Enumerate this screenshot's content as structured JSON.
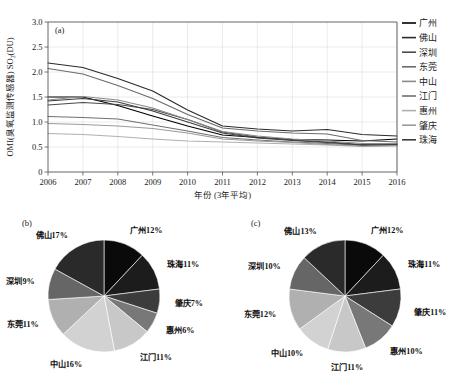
{
  "figure": {
    "panels": [
      "(a)",
      "(b)",
      "(c)"
    ]
  },
  "chart_data": [
    {
      "type": "line",
      "panel": "(a)",
      "title": "",
      "xlabel": "年份 (3年平均)",
      "ylabel": "OMI(臭氧监测传感器) SO₂(DU)",
      "x": [
        2006,
        2007,
        2008,
        2009,
        2010,
        2011,
        2012,
        2013,
        2014,
        2015,
        2016
      ],
      "xlim": [
        2006,
        2016
      ],
      "ylim": [
        0,
        3.0
      ],
      "yticks": [
        "0",
        "0.5",
        "1.0",
        "1.5",
        "2.0",
        "2.5",
        "3.0"
      ],
      "xticks": [
        "2006",
        "2007",
        "2008",
        "2009",
        "2010",
        "2011",
        "2012",
        "2013",
        "2014",
        "2015",
        "2016"
      ],
      "grid": true,
      "legend_position": "top-right",
      "series": [
        {
          "name": "广州",
          "color": "#000000",
          "values": [
            1.5,
            1.5,
            1.33,
            1.12,
            0.92,
            0.74,
            0.69,
            0.65,
            0.64,
            0.62,
            0.66
          ]
        },
        {
          "name": "佛山",
          "color": "#2b2b2b",
          "values": [
            2.18,
            2.09,
            1.87,
            1.62,
            1.24,
            0.92,
            0.86,
            0.82,
            0.85,
            0.75,
            0.72
          ]
        },
        {
          "name": "深圳",
          "color": "#4a4a4a",
          "values": [
            1.34,
            1.39,
            1.35,
            1.25,
            1.05,
            0.8,
            0.7,
            0.64,
            0.6,
            0.55,
            0.56
          ]
        },
        {
          "name": "东莞",
          "color": "#6b6b6b",
          "values": [
            2.07,
            1.96,
            1.73,
            1.47,
            1.15,
            0.88,
            0.82,
            0.78,
            0.76,
            0.63,
            0.6
          ]
        },
        {
          "name": "中山",
          "color": "#8a8a8a",
          "values": [
            1.44,
            1.51,
            1.44,
            1.28,
            1.05,
            0.81,
            0.72,
            0.66,
            0.62,
            0.57,
            0.57
          ]
        },
        {
          "name": "江门",
          "color": "#707070",
          "values": [
            1.11,
            1.09,
            1.06,
            0.94,
            0.82,
            0.69,
            0.64,
            0.6,
            0.57,
            0.53,
            0.54
          ]
        },
        {
          "name": "惠州",
          "color": "#b0b0b0",
          "values": [
            0.77,
            0.75,
            0.71,
            0.66,
            0.62,
            0.6,
            0.58,
            0.56,
            0.54,
            0.51,
            0.52
          ]
        },
        {
          "name": "肇庆",
          "color": "#9a9a9a",
          "values": [
            0.97,
            0.95,
            0.92,
            0.87,
            0.78,
            0.66,
            0.62,
            0.59,
            0.55,
            0.52,
            0.53
          ]
        },
        {
          "name": "珠海",
          "color": "#3d3d3d",
          "values": [
            1.42,
            1.47,
            1.4,
            1.22,
            1.0,
            0.78,
            0.68,
            0.63,
            0.59,
            0.54,
            0.55
          ]
        }
      ]
    },
    {
      "type": "pie",
      "panel": "(b)",
      "title": "",
      "labels": [
        "广州",
        "珠海",
        "肇庆",
        "惠州",
        "江门",
        "中山",
        "东莞",
        "深圳",
        "佛山"
      ],
      "values": [
        12,
        11,
        7,
        6,
        11,
        16,
        11,
        9,
        17
      ],
      "label_texts": [
        "广州12%",
        "珠海11%",
        "肇庆7%",
        "惠州6%",
        "江门11%",
        "中山16%",
        "东莞11%",
        "深圳9%",
        "佛山17%"
      ],
      "colors": [
        "#0a0a0a",
        "#1c1c1c",
        "#3c3c3c",
        "#787878",
        "#c8c8c8",
        "#d2d2d2",
        "#b0b0b0",
        "#666666",
        "#2a2a2a"
      ]
    },
    {
      "type": "pie",
      "panel": "(c)",
      "title": "",
      "labels": [
        "广州",
        "珠海",
        "肇庆",
        "惠州",
        "江门",
        "中山",
        "东莞",
        "深圳",
        "佛山"
      ],
      "values": [
        12,
        11,
        11,
        10,
        11,
        10,
        12,
        10,
        13
      ],
      "label_texts": [
        "广州12%",
        "珠海11%",
        "肇庆11%",
        "惠州10%",
        "江门11%",
        "中山10%",
        "东莞12%",
        "深圳10%",
        "佛山13%"
      ],
      "colors": [
        "#0a0a0a",
        "#1c1c1c",
        "#3c3c3c",
        "#787878",
        "#c8c8c8",
        "#d2d2d2",
        "#b0b0b0",
        "#666666",
        "#2a2a2a"
      ]
    }
  ]
}
